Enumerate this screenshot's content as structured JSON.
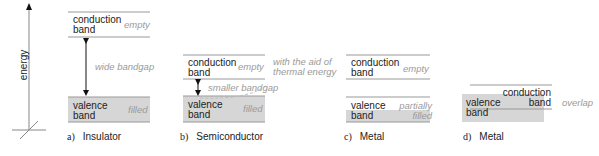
{
  "axis": {
    "label": "energy"
  },
  "panels": [
    {
      "letter": "a)",
      "title": "Insulator",
      "conduction": "conduction band",
      "conduction_state": "empty",
      "gap": "wide bandgap",
      "valence": "valence band",
      "valence_state": "filled"
    },
    {
      "letter": "b)",
      "title": "Semiconductor",
      "conduction": "conduction band",
      "conduction_state": "empty",
      "gap": "smaller bandgap",
      "valence": "valence band",
      "valence_state": "filled",
      "note": "with the aid of thermal energy"
    },
    {
      "letter": "c)",
      "title": "Metal",
      "conduction": "conduction band",
      "conduction_state": "empty",
      "valence": "valence band",
      "valence_state": "partially filled"
    },
    {
      "letter": "d)",
      "title": "Metal",
      "conduction": "conduction band",
      "valence": "valence band",
      "note": "overlap"
    }
  ],
  "colors": {
    "band_fill": "#d6d6d6",
    "line": "#999999",
    "annotation": "#9a9a9a"
  }
}
